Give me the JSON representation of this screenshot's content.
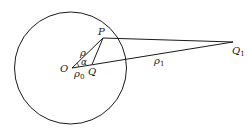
{
  "diagram": {
    "type": "geometry",
    "colors": {
      "stroke": "#1a1a1a",
      "background": "#ffffff"
    },
    "circle": {
      "cx": 70.5,
      "cy": 68,
      "r": 56
    },
    "points": {
      "O": {
        "x": 72,
        "y": 68,
        "label": "O"
      },
      "P": {
        "x": 103,
        "y": 38,
        "label": "P"
      },
      "Q": {
        "x": 92,
        "y": 64.5,
        "label": "Q"
      },
      "Q1": {
        "x": 233,
        "y": 42,
        "label": "Q",
        "subscript": "1"
      }
    },
    "edges": [
      {
        "from": "O",
        "to": "P",
        "label": "ρ"
      },
      {
        "from": "O",
        "to": "Q1",
        "label": "ρ",
        "label_subscript": "1"
      },
      {
        "from": "P",
        "to": "Q1",
        "label": ""
      },
      {
        "from": "P",
        "to": "Q",
        "label": ""
      }
    ],
    "labels": {
      "rho": "ρ",
      "alpha": "α",
      "rho0_main": "ρ",
      "rho0_sub": "0",
      "rho1_main": "ρ",
      "rho1_sub": "1",
      "O": "O",
      "P": "P",
      "Q": "Q",
      "Q1_main": "Q",
      "Q1_sub": "1"
    }
  }
}
